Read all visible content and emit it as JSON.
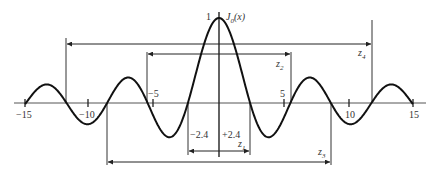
{
  "chart_data": {
    "type": "line",
    "title": "",
    "function_label": "J0(x)",
    "xlabel": "",
    "ylabel": "",
    "xlim": [
      -15,
      15
    ],
    "ylim": [
      -0.4,
      1
    ],
    "x_ticks": [
      -15,
      -10,
      -5,
      5,
      10,
      15
    ],
    "x_tick_labels": [
      "−15",
      "−10",
      "−5",
      "5",
      "10",
      "15"
    ],
    "y_tick_label": "1",
    "zero_markers": [
      {
        "name": "z1",
        "from": -2.4,
        "to": 2.4,
        "labels": [
          "−2.4",
          "+2.4"
        ]
      },
      {
        "name": "z2",
        "from": -5.52,
        "to": 5.52
      },
      {
        "name": "z3",
        "from": -8.65,
        "to": 8.65
      },
      {
        "name": "z4",
        "from": -11.79,
        "to": 11.79
      }
    ],
    "grid": false,
    "legend": "none"
  },
  "labels": {
    "peak": "1",
    "func_main": "J",
    "func_sub": "0",
    "func_arg": "(x)",
    "z1": "z",
    "z1_sub": "1",
    "z2": "z",
    "z2_sub": "2",
    "z3": "z",
    "z3_sub": "3",
    "z4": "z",
    "z4_sub": "4",
    "neg24": "−2.4",
    "pos24": "+2.4",
    "tick_m15": "−15",
    "tick_m10": "−10",
    "tick_m5": "−5",
    "tick_5": "5",
    "tick_10": "10",
    "tick_15": "15"
  }
}
